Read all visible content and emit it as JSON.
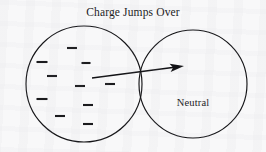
{
  "figure": {
    "title": "Charge Jumps Over",
    "background_color": "#f8f8f9",
    "ink_color": "#141417",
    "width": 266,
    "height": 152
  },
  "left_sphere": {
    "name": "charged-sphere",
    "center_x": 84,
    "center_y": 84,
    "radius": 58,
    "label": ""
  },
  "right_sphere": {
    "name": "neutral-sphere",
    "center_x": 193,
    "center_y": 84,
    "radius": 54,
    "label": "Neutral"
  },
  "charge_symbol": "minus",
  "charges": [
    {
      "x": 72,
      "y": 48,
      "w": 10
    },
    {
      "x": 42,
      "y": 62,
      "w": 11
    },
    {
      "x": 86,
      "y": 63,
      "w": 9
    },
    {
      "x": 52,
      "y": 76,
      "w": 10
    },
    {
      "x": 80,
      "y": 86,
      "w": 10
    },
    {
      "x": 110,
      "y": 84,
      "w": 10
    },
    {
      "x": 42,
      "y": 99,
      "w": 11
    },
    {
      "x": 88,
      "y": 105,
      "w": 10
    },
    {
      "x": 60,
      "y": 116,
      "w": 10
    },
    {
      "x": 88,
      "y": 124,
      "w": 10
    }
  ],
  "arrow": {
    "label": "charge-transfer-arrow",
    "tail_x": 92,
    "tail_y": 78,
    "tip_x": 184,
    "tip_y": 66
  }
}
